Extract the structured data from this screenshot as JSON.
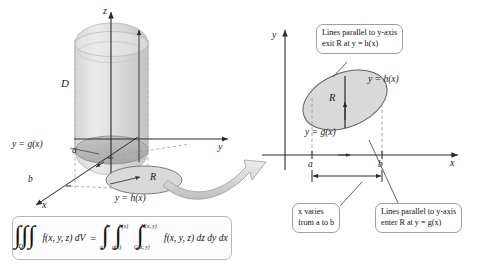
{
  "figure": {
    "type": "math-diagram",
    "topic": "Triple integral over a solid D projected onto plane region R"
  },
  "left_panel": {
    "name": "three-dimensional-solid",
    "solid_label": "D",
    "axis_labels": {
      "z": "z",
      "y": "y",
      "x": "x"
    },
    "region_label": "R",
    "curve_lower": "y = g(x)",
    "curve_upper": "y = h(x)",
    "tick_a": "a",
    "tick_b": "b"
  },
  "right_panel": {
    "name": "plane-region-R",
    "axis_labels": {
      "y": "y",
      "x": "x"
    },
    "region_label": "R",
    "curve_upper": "y = h(x)",
    "curve_lower": "y = g(x)",
    "tick_a": "a",
    "tick_b": "b",
    "callouts": [
      {
        "id": "exit",
        "line1": "Lines parallel to y-axis",
        "line2": "exit R at y = h(x)"
      },
      {
        "id": "xrange",
        "line1": "x varies",
        "line2": "from a to b"
      },
      {
        "id": "enter",
        "line1": "Lines parallel to y-axis",
        "line2": "enter R at y = g(x)"
      }
    ]
  },
  "formula": {
    "lhs_integrand": "f(x, y, z) dV",
    "lhs_sub": "D",
    "equals": "=",
    "outer_lower": "a",
    "outer_upper": "b",
    "middle_lower": "g(x)",
    "middle_upper": "h(x)",
    "inner_lower": "G(x, y)",
    "inner_upper": "H(x, y)",
    "rhs_integrand": "f(x, y, z) dz dy dx"
  },
  "colors": {
    "ink": "#1a1a1a",
    "axis": "#3a3a3a",
    "dashed": "#8a8a8a",
    "region_fill": "#d9d9d9",
    "region_stroke": "#6a6a6a",
    "solid_fill": "#dcdcdc",
    "arrow_fill": "#dcdcdc",
    "callout_border": "#9aa0a6"
  }
}
